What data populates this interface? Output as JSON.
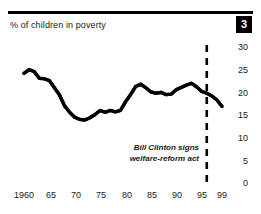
{
  "figure": {
    "number_badge": "3",
    "title": "% of children in poverty"
  },
  "annotation": {
    "line1": "Bill Clinton signs",
    "line2": "welfare-reform act"
  },
  "chart_data": {
    "type": "line",
    "title": "% of children in poverty",
    "xlabel": "",
    "ylabel": "",
    "xlim": [
      1959,
      2000
    ],
    "ylim": [
      0,
      30
    ],
    "grid": false,
    "legend": null,
    "line_color": "#000000",
    "y_ticks": [
      30,
      25,
      20,
      15,
      10,
      5,
      0
    ],
    "y_tick_labels": [
      "30",
      "25",
      "20",
      "15",
      "10",
      "5",
      "0"
    ],
    "x_ticks": [
      1960,
      1965,
      1970,
      1975,
      1980,
      1985,
      1990,
      1995,
      1999
    ],
    "x_tick_labels": [
      "1960",
      "65",
      "70",
      "75",
      "80",
      "85",
      "90",
      "95",
      "99"
    ],
    "annotations": [
      {
        "text": "Bill Clinton signs welfare-reform act",
        "x": 1996,
        "style": "dashed-vertical-line"
      }
    ],
    "series": [
      {
        "name": "% of children in poverty",
        "x": [
          1960,
          1961,
          1962,
          1963,
          1964,
          1965,
          1966,
          1967,
          1968,
          1969,
          1970,
          1971,
          1972,
          1973,
          1974,
          1975,
          1976,
          1977,
          1978,
          1979,
          1980,
          1981,
          1982,
          1983,
          1984,
          1985,
          1986,
          1987,
          1988,
          1989,
          1990,
          1991,
          1992,
          1993,
          1994,
          1995,
          1996,
          1997,
          1998,
          1999
        ],
        "values": [
          24.2,
          25.0,
          24.6,
          23.1,
          23.0,
          22.6,
          21.0,
          19.4,
          17.0,
          15.6,
          14.5,
          14.0,
          13.9,
          14.4,
          15.1,
          16.0,
          15.6,
          16.0,
          15.7,
          16.0,
          17.9,
          19.5,
          21.3,
          21.8,
          21.0,
          20.1,
          19.8,
          20.0,
          19.5,
          19.6,
          20.6,
          21.1,
          21.6,
          22.0,
          21.2,
          20.2,
          19.8,
          19.2,
          18.3,
          16.9
        ]
      }
    ]
  }
}
